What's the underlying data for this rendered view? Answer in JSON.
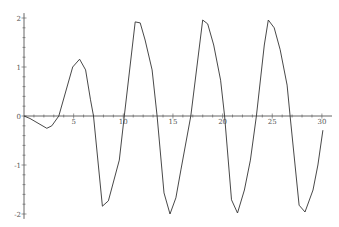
{
  "chart_data": {
    "type": "line",
    "title": "",
    "xlabel": "",
    "ylabel": "",
    "xlim": [
      0,
      30
    ],
    "ylim": [
      -2.1,
      2.1
    ],
    "grid": false,
    "legend": null,
    "x_ticks": [
      "0",
      "5",
      "10",
      "15",
      "20",
      "25",
      "30"
    ],
    "y_ticks": [
      "2",
      "1",
      "0",
      "-1",
      "-2"
    ],
    "line_color": "#333333",
    "series": [
      {
        "name": "f(x)",
        "x": [
          0,
          0.6,
          2.3,
          2.8,
          3.5,
          4.9,
          5.6,
          6.2,
          6.7,
          7.0,
          7.9,
          8.5,
          9.6,
          10.1,
          11.2,
          11.7,
          12.2,
          12.9,
          13.4,
          14.1,
          14.7,
          15.3,
          15.8,
          16.8,
          18.0,
          18.5,
          19.1,
          19.8,
          20.2,
          20.9,
          21.5,
          22.2,
          22.8,
          23.4,
          24.2,
          24.6,
          25.2,
          25.8,
          26.5,
          26.8,
          27.7,
          28.3,
          29.1,
          29.6,
          30.1
        ],
        "values": [
          0,
          -0.05,
          -0.25,
          -0.2,
          0,
          1.0,
          1.16,
          0.94,
          0.33,
          0,
          -1.84,
          -1.73,
          -0.9,
          0,
          1.92,
          1.9,
          1.55,
          0.94,
          0,
          -1.57,
          -2.0,
          -1.67,
          -1.1,
          0,
          1.96,
          1.88,
          1.45,
          0.73,
          0,
          -1.71,
          -1.98,
          -1.51,
          -0.9,
          0,
          1.45,
          1.96,
          1.8,
          1.35,
          0.63,
          0,
          -1.82,
          -1.96,
          -1.51,
          -1.0,
          -0.29
        ]
      }
    ]
  }
}
